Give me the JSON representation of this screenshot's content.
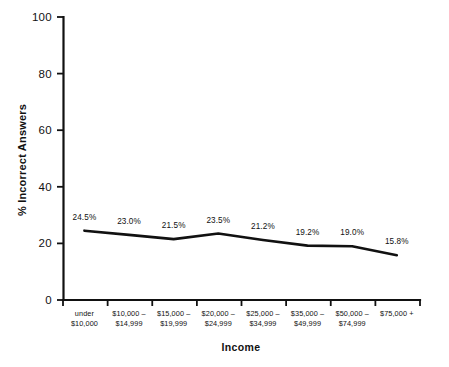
{
  "chart_data": {
    "type": "line",
    "title": "",
    "xlabel": "Income",
    "ylabel": "% Incorrect Answers",
    "ylim": [
      0,
      100
    ],
    "yticks": [
      0,
      20,
      40,
      60,
      80,
      100
    ],
    "ytick_labels": [
      "0",
      "20",
      "40",
      "60",
      "80",
      "100"
    ],
    "grid": false,
    "legend": "none",
    "categories": [
      "under\n$10,000",
      "$10,000 –\n$14,999",
      "$15,000 –\n$19,999",
      "$20,000 –\n$24,999",
      "$25,000 –\n$34,999",
      "$35,000 –\n$49,999",
      "$50,000 –\n$74,999",
      "$75,000 +"
    ],
    "category_lines": [
      [
        "under",
        "$10,000"
      ],
      [
        "$10,000 –",
        "$14,999"
      ],
      [
        "$15,000 –",
        "$19,999"
      ],
      [
        "$20,000 –",
        "$24,999"
      ],
      [
        "$25,000 –",
        "$34,999"
      ],
      [
        "$35,000 –",
        "$49,999"
      ],
      [
        "$50,000 –",
        "$74,999"
      ],
      [
        "$75,000 +",
        ""
      ]
    ],
    "values": [
      24.5,
      23.0,
      21.5,
      23.5,
      21.2,
      19.2,
      19.0,
      15.8
    ],
    "value_labels": [
      "24.5%",
      "23.0%",
      "21.5%",
      "23.5%",
      "21.2%",
      "19.2%",
      "19.0%",
      "15.8%"
    ],
    "series_color": "#111111",
    "background_color": "#ffffff"
  },
  "axis": {
    "y_title": "% Incorrect Answers",
    "x_title": "Income"
  }
}
